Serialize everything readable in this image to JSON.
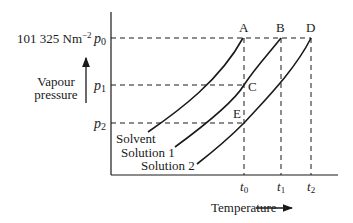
{
  "diagram": {
    "type": "vapour-pressure-temperature",
    "y_axis": {
      "label_line1": "Vapour",
      "label_line2": "pressure",
      "ticks": [
        {
          "name": "p0",
          "base": "p",
          "sub": "0",
          "annotation": "101 325 Nm",
          "annotation_exp": "−2"
        },
        {
          "name": "p1",
          "base": "p",
          "sub": "1"
        },
        {
          "name": "p2",
          "base": "p",
          "sub": "2"
        }
      ]
    },
    "x_axis": {
      "label": "Temperature",
      "ticks": [
        {
          "name": "t0",
          "base": "t",
          "sub": "0"
        },
        {
          "name": "t1",
          "base": "t",
          "sub": "1"
        },
        {
          "name": "t2",
          "base": "t",
          "sub": "2"
        }
      ]
    },
    "points": {
      "A": "A",
      "B": "B",
      "C": "C",
      "D": "D",
      "E": "E"
    },
    "curves": [
      {
        "name": "solvent",
        "label": "Solvent"
      },
      {
        "name": "solution-1",
        "label": "Solution 1"
      },
      {
        "name": "solution-2",
        "label": "Solution 2"
      }
    ],
    "colors": {
      "ink": "#1a1a1a",
      "background": "#ffffff"
    }
  }
}
